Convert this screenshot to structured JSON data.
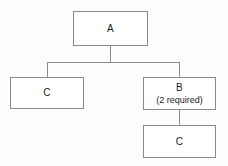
{
  "diagram": {
    "type": "block-diagram",
    "colors": {
      "background": "#fdfdfd",
      "box_fill": "#ffffff",
      "border": "#8a8a8a",
      "text": "#1a1a1a",
      "connector": "#8a8a8a"
    },
    "nodes": [
      {
        "id": "a",
        "label": "A",
        "sublabel": "",
        "x": 73,
        "y": 11,
        "width": 75,
        "height": 35
      },
      {
        "id": "c_left",
        "label": "C",
        "sublabel": "",
        "x": 10,
        "y": 77,
        "width": 74,
        "height": 32
      },
      {
        "id": "b",
        "label": "B",
        "sublabel": "(2 required)",
        "x": 143,
        "y": 77,
        "width": 73,
        "height": 33
      },
      {
        "id": "c_bottom",
        "label": "C",
        "sublabel": "",
        "x": 143,
        "y": 125,
        "width": 73,
        "height": 33
      }
    ],
    "edges": [
      {
        "id": "a-stem",
        "from": "a",
        "to": "bus",
        "orientation": "vertical"
      },
      {
        "id": "bus",
        "from": "a",
        "to": "children",
        "orientation": "horizontal"
      },
      {
        "id": "bus-to-c-left",
        "from": "bus",
        "to": "c_left",
        "orientation": "vertical"
      },
      {
        "id": "bus-to-b",
        "from": "bus",
        "to": "b",
        "orientation": "vertical"
      },
      {
        "id": "b-to-c-bottom",
        "from": "b",
        "to": "c_bottom",
        "orientation": "vertical"
      }
    ]
  }
}
